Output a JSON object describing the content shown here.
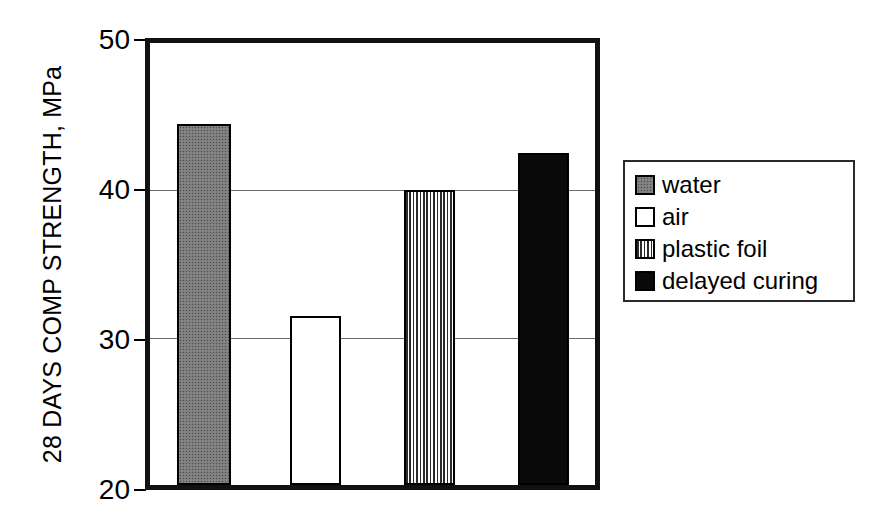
{
  "chart_data": {
    "type": "bar",
    "title": "",
    "xlabel": "",
    "ylabel": "28 DAYS COMP STRENGTH, MPa",
    "categories": [
      "water",
      "air",
      "plastic foil",
      "delayed curing"
    ],
    "values": [
      44.5,
      31.5,
      40.0,
      42.5
    ],
    "ylim": [
      20,
      50
    ],
    "yticks": [
      20,
      30,
      40,
      50
    ],
    "ytick_labels": [
      "20",
      "30",
      "40",
      "50"
    ],
    "xticks": [],
    "xtick_labels": [],
    "grid": "horizontal",
    "legend_position": "right-outside",
    "series": [
      {
        "name": "water",
        "value": 44.5,
        "fill": "stipple-gray",
        "color": "#7d7d7d"
      },
      {
        "name": "air",
        "value": 31.5,
        "fill": "solid-white",
        "color": "#ffffff"
      },
      {
        "name": "plastic foil",
        "value": 40.0,
        "fill": "vertical-lines",
        "color": "#8a8a8a"
      },
      {
        "name": "delayed curing",
        "value": 42.5,
        "fill": "solid-black",
        "color": "#0a0a0a"
      }
    ],
    "colors": {
      "axis": "#111111",
      "gridline": "#6b6b6b",
      "background": "#ffffff",
      "text": "#000000"
    }
  },
  "axis": {
    "y_title": "28 DAYS COMP STRENGTH, MPa",
    "ticks": [
      {
        "label": "50",
        "value": 50
      },
      {
        "label": "40",
        "value": 40
      },
      {
        "label": "30",
        "value": 30
      },
      {
        "label": "20",
        "value": 20
      }
    ]
  },
  "legend": {
    "items": [
      {
        "label": "water",
        "swatch": "stipple-gray"
      },
      {
        "label": "air",
        "swatch": "solid-white"
      },
      {
        "label": "plastic foil",
        "swatch": "vertical-lines"
      },
      {
        "label": "delayed curing",
        "swatch": "solid-black"
      }
    ]
  }
}
